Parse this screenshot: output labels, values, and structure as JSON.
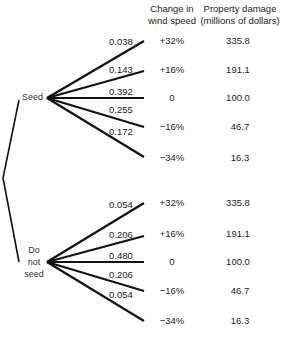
{
  "headers": {
    "change_line1": "Change in",
    "change_line2": "wind speed",
    "damage_line1": "Property damage",
    "damage_line2": "(millions of dollars)"
  },
  "decisions": [
    {
      "label": "Seed",
      "outcomes": [
        {
          "probability": "0.038",
          "change": "+32%",
          "damage": "335.8"
        },
        {
          "probability": "0.143",
          "change": "+16%",
          "damage": "191.1"
        },
        {
          "probability": "0.392",
          "change": "0",
          "damage": "100.0"
        },
        {
          "probability": "0.255",
          "change": "−16%",
          "damage": "46.7"
        },
        {
          "probability": "0.172",
          "change": "−34%",
          "damage": "16.3"
        }
      ]
    },
    {
      "label_lines": [
        "Do",
        "not",
        "seed"
      ],
      "outcomes": [
        {
          "probability": "0.054",
          "change": "+32%",
          "damage": "335.8"
        },
        {
          "probability": "0.206",
          "change": "+16%",
          "damage": "191.1"
        },
        {
          "probability": "0.480",
          "change": "0",
          "damage": "100.0"
        },
        {
          "probability": "0.206",
          "change": "−16%",
          "damage": "46.7"
        },
        {
          "probability": "0.054",
          "change": "−34%",
          "damage": "16.3"
        }
      ]
    }
  ],
  "colors": {
    "line": "#111111",
    "text": "#1a1a1a"
  }
}
